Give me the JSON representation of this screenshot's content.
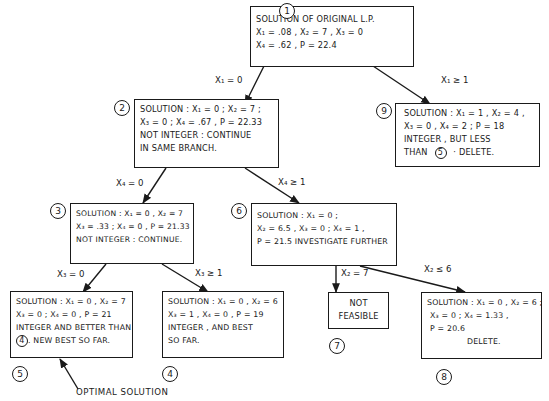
{
  "diagram": {
    "type": "branch-and-bound-tree",
    "nodes": [
      {
        "id": "1",
        "lines": [
          "SOLUTION  OF ORIGINAL L.P.",
          "X₁ = .08 ,  X₂ = 7 ,  X₃ = 0",
          "X₄ = .62 ,   P = 22.4"
        ]
      },
      {
        "id": "2",
        "lines": [
          "SOLUTION : X₁ = 0 ;  X₂ = 7 ;",
          "X₃ = 0 ;  X₄ = .67 ,  P = 22.33",
          "NOT INTEGER : CONTINUE",
          "IN SAME BRANCH."
        ]
      },
      {
        "id": "3",
        "lines": [
          "SOLUTION : X₁ = 0 ,  X₂ = 7",
          "X₃ = .33 ;  X₄ = 0 ,  P = 21.33",
          "NOT INTEGER : CONTINUE."
        ]
      },
      {
        "id": "4",
        "lines": [
          "SOLUTION : X₁ = 0 , X₂ = 6",
          "X₃ = 1 ,  X₄ = 0 ,   P = 19",
          "INTEGER , AND BEST",
          "SO FAR."
        ]
      },
      {
        "id": "5",
        "lines": [
          "SOLUTION :  X₁ = 0 ,  X₂ = 7",
          "X₃ = 0 ;  X₄ = 0 ,   P = 21",
          "INTEGER AND BETTER THAN",
          ". NEW BEST SO FAR."
        ],
        "ref": "4"
      },
      {
        "id": "6",
        "lines": [
          "SOLUTION :  X₁ = 0 ;",
          "X₂ = 6.5 ,  X₃ = 0 ;  X₄ = 1 ,",
          "P = 21.5   INVESTIGATE FURTHER"
        ]
      },
      {
        "id": "7",
        "lines": [
          "NOT",
          "FEASIBLE"
        ]
      },
      {
        "id": "8",
        "lines": [
          "SOLUTION : X₁ = 0 , X₂ = 6 ;",
          "X₃ = 0 ;  X₄ = 1.33 ,",
          "P = 20.6",
          "DELETE."
        ]
      },
      {
        "id": "9",
        "lines": [
          "SOLUTION : X₁ = 1 ,  X₂ = 4 ,",
          "X₃ = 0 ,  X₄ = 2 ;   P = 18",
          "INTEGER ,  BUT LESS",
          "THAN",
          "·  DELETE."
        ],
        "ref": "5"
      }
    ],
    "edges": [
      {
        "from": "1",
        "to": "2",
        "label": "X₁ = 0"
      },
      {
        "from": "1",
        "to": "9",
        "label": "X₁ ≥ 1"
      },
      {
        "from": "2",
        "to": "3",
        "label": "X₄ = 0"
      },
      {
        "from": "2",
        "to": "6",
        "label": "X₄ ≥ 1"
      },
      {
        "from": "3",
        "to": "5",
        "label": "X₃ = 0"
      },
      {
        "from": "3",
        "to": "4",
        "label": "X₃ ≥ 1"
      },
      {
        "from": "6",
        "to": "7",
        "label": "X₂ = 7"
      },
      {
        "from": "6",
        "to": "8",
        "label": "X₂ ≤ 6"
      }
    ],
    "annotation": {
      "text": "OPTIMAL SOLUTION",
      "points_to": "5"
    }
  }
}
